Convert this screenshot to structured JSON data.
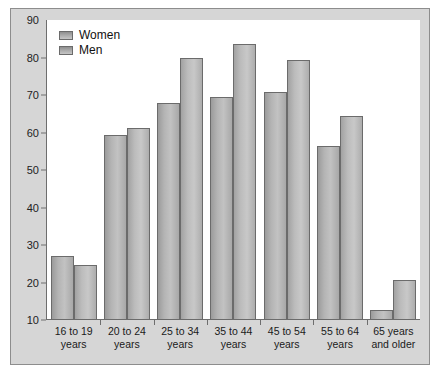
{
  "chart_data": {
    "type": "bar",
    "title": "",
    "xlabel": "",
    "ylabel": "",
    "ylim": [
      10,
      90
    ],
    "ytick_step": 10,
    "yticks": [
      10,
      20,
      30,
      40,
      50,
      60,
      70,
      80,
      90
    ],
    "grid": false,
    "legend_position": "top-left",
    "categories": [
      "16 to 19 years",
      "20 to 24 years",
      "25 to 34 years",
      "35 to 44 years",
      "45 to 54 years",
      "55 to 64 years",
      "65 years and older"
    ],
    "category_lines": [
      [
        "16 to 19",
        "years"
      ],
      [
        "20 to 24",
        "years"
      ],
      [
        "25 to 34",
        "years"
      ],
      [
        "35 to 44",
        "years"
      ],
      [
        "45 to 54",
        "years"
      ],
      [
        "55 to 64",
        "years"
      ],
      [
        "65 years",
        "and older"
      ]
    ],
    "series": [
      {
        "name": "Women",
        "color": "#b0b0b0",
        "values": [
          27.0,
          59.4,
          68.0,
          69.5,
          70.7,
          56.3,
          12.8
        ]
      },
      {
        "name": "Men",
        "color": "#bcbcbc",
        "values": [
          24.7,
          61.3,
          79.8,
          83.5,
          79.3,
          64.3,
          20.6
        ]
      }
    ]
  },
  "legend": {
    "items": [
      {
        "label": "Women"
      },
      {
        "label": "Men"
      }
    ]
  },
  "colors": {
    "frame_background": "#d6d6d6",
    "frame_border": "#8d8d8d",
    "plot_background": "#ffffff",
    "axis_line": "#6e6e6e",
    "bar_outline": "#6b6b6b",
    "tick_text": "#222222",
    "label_text": "#1a1a1a"
  }
}
